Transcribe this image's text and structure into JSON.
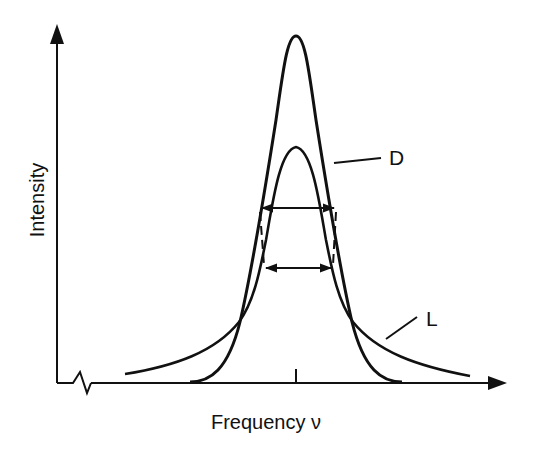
{
  "figure": {
    "type": "line-shape-comparison"
  },
  "axes": {
    "x": {
      "label": "Frequency ν",
      "has_break": true,
      "center_tick": true
    },
    "y": {
      "label": "Intensity"
    }
  },
  "curves": [
    {
      "id": "D",
      "label": "D",
      "profile": "Gaussian (Doppler)",
      "relative_peak_height": 1.0,
      "relative_width": "narrow tails"
    },
    {
      "id": "L",
      "label": "L",
      "profile": "Lorentzian",
      "relative_peak_height": 0.68,
      "relative_width": "broad wings"
    }
  ],
  "annotations": {
    "fwhm_arrows": [
      {
        "curve": "D",
        "description": "full width at half maximum of D"
      },
      {
        "curve": "L",
        "description": "full width at half maximum of L"
      }
    ],
    "dashed_connectors": 2
  },
  "colors": {
    "stroke": "#111111",
    "background": "#ffffff"
  }
}
